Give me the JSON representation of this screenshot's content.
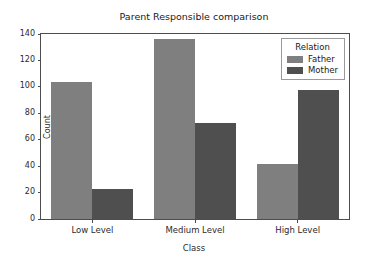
{
  "chart_data": {
    "type": "bar",
    "title": "Parent Responsible comparison",
    "xlabel": "Class",
    "ylabel": "Count",
    "categories": [
      "Low Level",
      "Medium Level",
      "High Level"
    ],
    "series": [
      {
        "name": "Father",
        "color": "#7f7f7f",
        "values": [
          104,
          136,
          42
        ]
      },
      {
        "name": "Mother",
        "color": "#4f4f4f",
        "values": [
          23,
          73,
          98
        ]
      }
    ],
    "ylim": [
      0,
      140
    ],
    "yticks": [
      0,
      20,
      40,
      60,
      80,
      100,
      120,
      140
    ],
    "ytick_labels": [
      "0",
      "20",
      "40",
      "60",
      "80",
      "100",
      "120",
      "140"
    ],
    "grid": false,
    "legend": {
      "title": "Relation",
      "position": "upper right",
      "entries": [
        "Father",
        "Mother"
      ]
    }
  }
}
